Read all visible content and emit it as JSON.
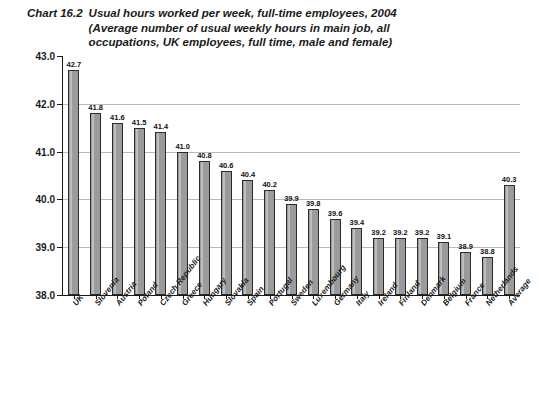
{
  "title": {
    "chart_number": "Chart 16.2",
    "lines": [
      "Usual hours worked per week, full-time employees, 2004",
      "(Average number of usual weekly hours in main job, all",
      "occupations, UK employees, full time, male and female)"
    ]
  },
  "colors": {
    "bar_fill": "#9b9b9b",
    "bar_stroke": "#2b2b2b",
    "gridline": "#b9b9b9",
    "axis": "#1a1a1a",
    "text": "#1a1a1a",
    "background": "#ffffff"
  },
  "chart_data": {
    "type": "bar",
    "title": "Usual hours worked per week, full-time employees, 2004 (Average number of usual weekly hours in main job, all occupations, UK employees, full time, male and female)",
    "xlabel": "",
    "ylabel": "Hours",
    "ylim": [
      38.0,
      43.0
    ],
    "yticks": [
      38.0,
      39.0,
      40.0,
      41.0,
      42.0,
      43.0
    ],
    "ytick_labels": [
      "38.0",
      "39.0",
      "40.0",
      "41.0",
      "42.0",
      "43.0"
    ],
    "grid": true,
    "grid_axis": "y",
    "legend": false,
    "data_labels": true,
    "categories": [
      "UK",
      "Slovenia",
      "Austria",
      "Poland",
      "Czech Republic",
      "Greece",
      "Hungary",
      "Slovakia",
      "Spain",
      "Portugal",
      "Sweden",
      "Luxembourg",
      "Germany",
      "Italy",
      "Ireland",
      "Finland",
      "Denmark",
      "Belgium",
      "France",
      "Netherlands",
      "Average"
    ],
    "values": [
      42.7,
      41.8,
      41.6,
      41.5,
      41.4,
      41.0,
      40.8,
      40.6,
      40.4,
      40.2,
      39.9,
      39.8,
      39.6,
      39.4,
      39.2,
      39.2,
      39.2,
      39.1,
      38.9,
      38.8,
      40.3
    ],
    "value_labels": [
      "42.7",
      "41.8",
      "41.6",
      "41.5",
      "41.4",
      "41.0",
      "40.8",
      "40.6",
      "40.4",
      "40.2",
      "39.9",
      "39.8",
      "39.6",
      "39.4",
      "39.2",
      "39.2",
      "39.2",
      "39.1",
      "38.9",
      "38.8",
      "40.3"
    ]
  }
}
